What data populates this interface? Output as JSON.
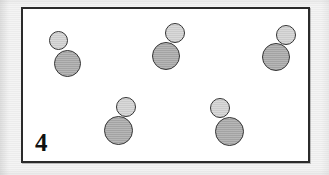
{
  "figure": {
    "label": "4",
    "background_color": "#f0f0f0",
    "panel_background_color": "#ffffff",
    "panel_border_color": "#2b2b2b",
    "small_circle_color": "#d2d2d2",
    "large_circle_color": "#a9a9a9",
    "outline_color": "#333333",
    "shape_count": 5,
    "shapes": [
      {
        "name": "snowman-1",
        "left": 25,
        "top": 20,
        "small": {
          "cx": 10,
          "cy": 11,
          "d": 19
        },
        "large": {
          "cx": 19,
          "cy": 34,
          "d": 27
        }
      },
      {
        "name": "snowman-2",
        "left": 128,
        "top": 13,
        "small": {
          "cx": 24,
          "cy": 11,
          "d": 20
        },
        "large": {
          "cx": 15,
          "cy": 34,
          "d": 28
        }
      },
      {
        "name": "snowman-3",
        "left": 233,
        "top": 15,
        "small": {
          "cx": 30,
          "cy": 11,
          "d": 20
        },
        "large": {
          "cx": 20,
          "cy": 33,
          "d": 28
        }
      },
      {
        "name": "snowman-4",
        "left": 78,
        "top": 87,
        "small": {
          "cx": 25,
          "cy": 11,
          "d": 20
        },
        "large": {
          "cx": 17,
          "cy": 34,
          "d": 29
        }
      },
      {
        "name": "snowman-5",
        "left": 180,
        "top": 88,
        "small": {
          "cx": 17,
          "cy": 11,
          "d": 20
        },
        "large": {
          "cx": 26,
          "cy": 34,
          "d": 29
        }
      }
    ]
  }
}
